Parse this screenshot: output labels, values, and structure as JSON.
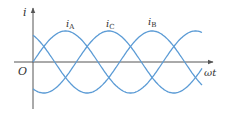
{
  "figure": {
    "y_axis_label": "i",
    "x_axis_label": "ωt",
    "origin_label": "O",
    "curve_labels": [
      {
        "base": "i",
        "sub": "A"
      },
      {
        "base": "i",
        "sub": "C"
      },
      {
        "base": "i",
        "sub": "B"
      }
    ],
    "colors": {
      "curve": "#5b9bd5",
      "axis": "#555555",
      "text": "#333333"
    }
  },
  "chart_data": {
    "type": "line",
    "title": "",
    "xlabel": "ωt",
    "ylabel": "i",
    "grid": false,
    "series": [
      {
        "name": "iA",
        "function": "sin(ωt)",
        "phase_deg": 0
      },
      {
        "name": "iB",
        "function": "sin(ωt - 120°)",
        "phase_deg": -120
      },
      {
        "name": "iC",
        "function": "sin(ωt + 120°)",
        "phase_deg": 120
      }
    ],
    "x_range_periods": [
      0,
      1.3
    ],
    "amplitude": 1
  }
}
